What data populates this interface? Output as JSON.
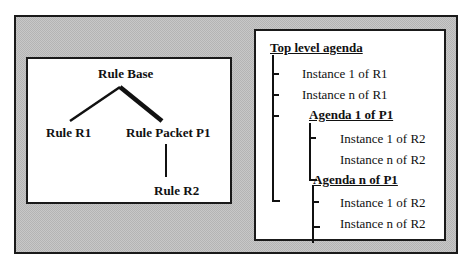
{
  "left_panel": {
    "title": "Rule-base structure",
    "nodes": {
      "root": "Rule Base",
      "rule_r1": "Rule R1",
      "packet_p1": "Rule Packet P1",
      "rule_r2": "Rule R2"
    }
  },
  "right_panel": {
    "root": "Top level agenda",
    "items": [
      {
        "label": "Instance 1 of R1",
        "level": 1
      },
      {
        "label": "Instance n of R1",
        "level": 1
      },
      {
        "label": "Agenda 1 of P1",
        "level": 1,
        "heading": true
      },
      {
        "label": "Instance 1 of R2",
        "level": 2
      },
      {
        "label": "Instance n of R2",
        "level": 2
      },
      {
        "label": "Agenda n of P1",
        "level": 1,
        "heading": true
      },
      {
        "label": "Instance 1 of R2",
        "level": 2
      },
      {
        "label": "Instance n of R2",
        "level": 2
      }
    ]
  }
}
